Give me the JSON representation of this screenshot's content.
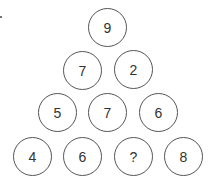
{
  "puzzle": {
    "rows": [
      [
        "9"
      ],
      [
        "7",
        "2"
      ],
      [
        "5",
        "7",
        "6"
      ],
      [
        "4",
        "6",
        "?",
        "8"
      ]
    ]
  }
}
